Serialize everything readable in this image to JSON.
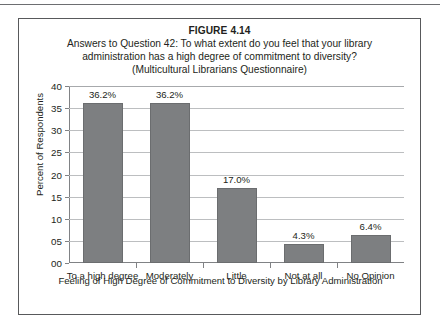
{
  "figure": {
    "number_label": "FIGURE 4.14",
    "caption_lines": [
      "Answers to Question 42: To what extent do you feel that your library",
      "administration has a high degree of commitment to diversity?",
      "(Multicultural Librarians Questionnaire)"
    ]
  },
  "chart_data": {
    "type": "bar",
    "title": "FIGURE 4.14",
    "subtitle": "Answers to Question 42: To what extent do you feel that your library administration has a high degree of commitment to diversity? (Multicultural Librarians Questionnaire)",
    "categories": [
      "To a high degree",
      "Moderately",
      "Little",
      "Not at all",
      "No Opinion"
    ],
    "values": [
      36.2,
      36.2,
      17.0,
      4.3,
      6.4
    ],
    "data_labels": [
      "36.2%",
      "36.2%",
      "17.0%",
      "4.3%",
      "6.4%"
    ],
    "xlabel": "Feeling of High Degree of Commitment to Diversity by Library Administration",
    "ylabel": "Percent of Respondents",
    "ylim": [
      0,
      40
    ],
    "ytick_values": [
      0,
      5,
      10,
      15,
      20,
      25,
      30,
      35,
      40
    ],
    "ytick_labels": [
      "00",
      "05",
      "10",
      "15",
      "20",
      "25",
      "30",
      "35",
      "40"
    ],
    "grid": true,
    "legend": false,
    "bar_color": "#7d7f81",
    "gridline_color": "#bcbec0"
  }
}
